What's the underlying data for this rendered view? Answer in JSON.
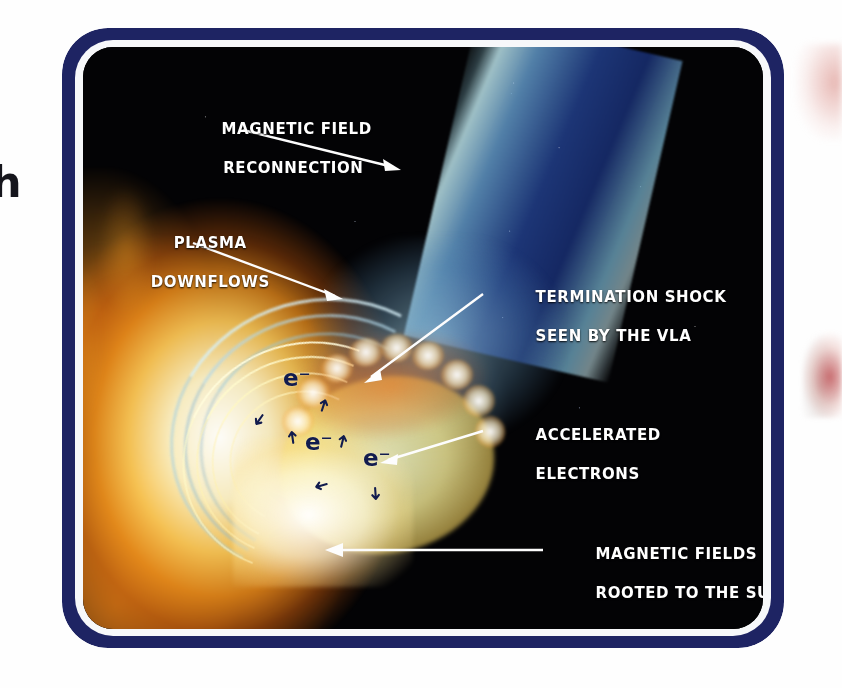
{
  "figure": {
    "kind": "scientific-illustration",
    "frame_color": "#1e2463",
    "space_color": "#030305",
    "jet_color": "#1e387c",
    "flare_color": "#f3921c",
    "electron_color": "#121c4e",
    "label_color": "#ffffff"
  },
  "labels": [
    {
      "id": "magnetic-field-reconnection",
      "line1": "MAGNETIC FIELD",
      "line2": "RECONNECTION"
    },
    {
      "id": "plasma-downflows",
      "line1": "PLASMA",
      "line2": "DOWNFLOWS"
    },
    {
      "id": "termination-shock",
      "line1": "TERMINATION SHOCK",
      "line2": "SEEN BY THE VLA"
    },
    {
      "id": "accelerated-electrons",
      "line1": "ACCELERATED",
      "line2": "ELECTRONS"
    },
    {
      "id": "magnetic-fields-rooted",
      "line1": "MAGNETIC FIELDS",
      "line2": "ROOTED TO THE SUN"
    }
  ],
  "electrons": [
    {
      "symbol": "e⁻"
    },
    {
      "symbol": "e⁻"
    },
    {
      "symbol": "e⁻"
    }
  ],
  "page_edge": {
    "cut_glyph": "h"
  }
}
